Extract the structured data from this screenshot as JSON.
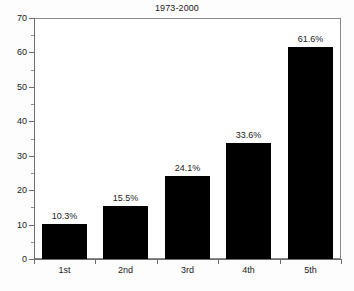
{
  "chart_data": {
    "type": "bar",
    "title": "1973-2000",
    "xlabel": "",
    "ylabel": "",
    "categories": [
      "1st",
      "2nd",
      "3rd",
      "4th",
      "5th"
    ],
    "values": [
      10.3,
      15.5,
      24.1,
      33.6,
      61.6
    ],
    "data_labels": [
      "10.3%",
      "15.5%",
      "24.1%",
      "33.6%",
      "61.6%"
    ],
    "ylim": [
      0,
      70
    ],
    "ytick_major": [
      0,
      10,
      20,
      30,
      40,
      50,
      60,
      70
    ],
    "ytick_major_labels": [
      "0",
      "10",
      "20",
      "30",
      "40",
      "50",
      "60",
      "70"
    ],
    "ytick_minor": [
      5,
      15,
      25,
      35,
      45,
      55,
      65
    ],
    "grid": false,
    "legend": null,
    "bar_color": "#000000",
    "plot_background": "#ffffff",
    "axis_color": "#6d6d6d",
    "text_color": "#1a1a1a"
  }
}
